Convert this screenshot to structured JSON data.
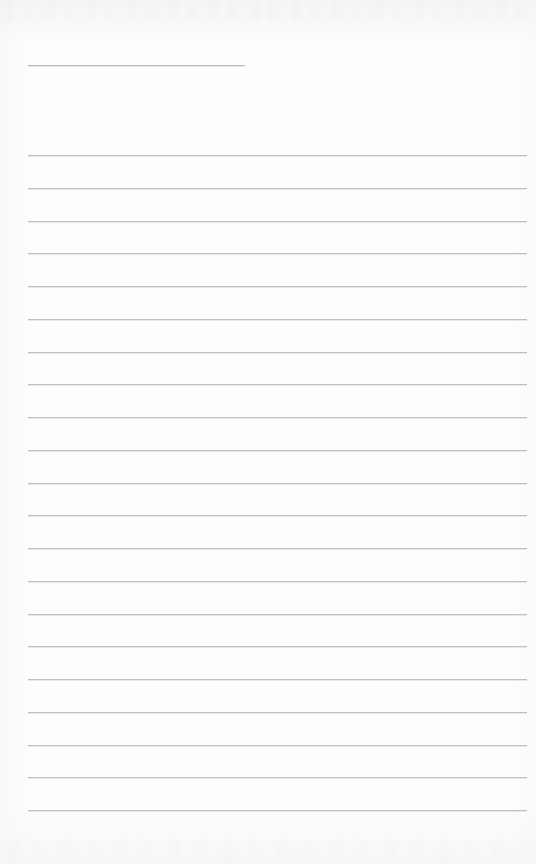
{
  "document": {
    "kind": "scanned-lined-page",
    "orientation": "portrait",
    "page_width": 536,
    "page_height": 864,
    "background_color": "#fdfdfd",
    "rule_color": "#b9babe",
    "text_content": "",
    "visible_text": []
  },
  "layout": {
    "left_margin": 28,
    "right_edge": 527,
    "header_rule": {
      "name": "header-rule",
      "x_start": 28,
      "x_end": 245,
      "y": 65,
      "width": 217,
      "thickness": 1
    },
    "body_rules": {
      "count": 21,
      "x_start": 28,
      "x_end": 527,
      "width": 499,
      "first_y": 155,
      "spacing": 32.75,
      "last_y": 810,
      "thickness": 1
    }
  },
  "rules": [
    {
      "id": "header-rule",
      "y": 65,
      "x": 28,
      "width": 217,
      "kind": "short"
    },
    {
      "id": "body-rule-1",
      "y": 155,
      "x": 28,
      "width": 499,
      "kind": "full"
    },
    {
      "id": "body-rule-2",
      "y": 188,
      "x": 28,
      "width": 499,
      "kind": "full"
    },
    {
      "id": "body-rule-3",
      "y": 221,
      "x": 28,
      "width": 499,
      "kind": "full"
    },
    {
      "id": "body-rule-4",
      "y": 253,
      "x": 28,
      "width": 499,
      "kind": "full"
    },
    {
      "id": "body-rule-5",
      "y": 286,
      "x": 28,
      "width": 499,
      "kind": "full"
    },
    {
      "id": "body-rule-6",
      "y": 319,
      "x": 28,
      "width": 499,
      "kind": "full"
    },
    {
      "id": "body-rule-7",
      "y": 352,
      "x": 28,
      "width": 499,
      "kind": "full"
    },
    {
      "id": "body-rule-8",
      "y": 384,
      "x": 28,
      "width": 499,
      "kind": "full"
    },
    {
      "id": "body-rule-9",
      "y": 417,
      "x": 28,
      "width": 499,
      "kind": "full"
    },
    {
      "id": "body-rule-10",
      "y": 450,
      "x": 28,
      "width": 499,
      "kind": "full"
    },
    {
      "id": "body-rule-11",
      "y": 483,
      "x": 28,
      "width": 499,
      "kind": "full"
    },
    {
      "id": "body-rule-12",
      "y": 515,
      "x": 28,
      "width": 499,
      "kind": "full"
    },
    {
      "id": "body-rule-13",
      "y": 548,
      "x": 28,
      "width": 499,
      "kind": "full"
    },
    {
      "id": "body-rule-14",
      "y": 581,
      "x": 28,
      "width": 499,
      "kind": "full"
    },
    {
      "id": "body-rule-15",
      "y": 614,
      "x": 28,
      "width": 499,
      "kind": "full"
    },
    {
      "id": "body-rule-16",
      "y": 646,
      "x": 28,
      "width": 499,
      "kind": "full"
    },
    {
      "id": "body-rule-17",
      "y": 679,
      "x": 28,
      "width": 499,
      "kind": "full"
    },
    {
      "id": "body-rule-18",
      "y": 712,
      "x": 28,
      "width": 499,
      "kind": "full"
    },
    {
      "id": "body-rule-19",
      "y": 745,
      "x": 28,
      "width": 499,
      "kind": "full"
    },
    {
      "id": "body-rule-20",
      "y": 777,
      "x": 28,
      "width": 499,
      "kind": "full"
    },
    {
      "id": "body-rule-21",
      "y": 810,
      "x": 28,
      "width": 499,
      "kind": "full"
    }
  ]
}
